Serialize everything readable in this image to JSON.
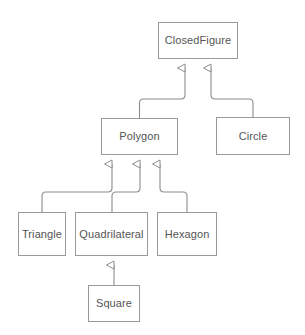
{
  "diagram": {
    "kind": "uml-class-diagram",
    "background_color": "#ffffff",
    "stroke_color": "#9a9a9a",
    "text_color": "#555555",
    "edge_color": "#8c8c8c",
    "nodes": [
      {
        "id": "closedfigure",
        "label": "ClosedFigure",
        "x": 158,
        "y": 22,
        "w": 80,
        "h": 37
      },
      {
        "id": "polygon",
        "label": "Polygon",
        "x": 101,
        "y": 118,
        "w": 77,
        "h": 37
      },
      {
        "id": "circle",
        "label": "Circle",
        "x": 216,
        "y": 117,
        "w": 74,
        "h": 38
      },
      {
        "id": "triangle",
        "label": "Triangle",
        "x": 18,
        "y": 212,
        "w": 48,
        "h": 44
      },
      {
        "id": "quadrilateral",
        "label": "Quadrilateral",
        "x": 75,
        "y": 212,
        "w": 73,
        "h": 44
      },
      {
        "id": "hexagon",
        "label": "Hexagon",
        "x": 157,
        "y": 212,
        "w": 60,
        "h": 44
      },
      {
        "id": "square",
        "label": "Square",
        "x": 88,
        "y": 285,
        "w": 52,
        "h": 37
      }
    ],
    "edges": [
      {
        "id": "polygon-to-closedfigure",
        "from": "polygon",
        "to": "closedfigure",
        "type": "generalization"
      },
      {
        "id": "circle-to-closedfigure",
        "from": "circle",
        "to": "closedfigure",
        "type": "generalization"
      },
      {
        "id": "triangle-to-polygon",
        "from": "triangle",
        "to": "polygon",
        "type": "generalization"
      },
      {
        "id": "quadrilateral-to-polygon",
        "from": "quadrilateral",
        "to": "polygon",
        "type": "generalization"
      },
      {
        "id": "hexagon-to-polygon",
        "from": "hexagon",
        "to": "polygon",
        "type": "generalization"
      },
      {
        "id": "square-to-quadrilateral",
        "from": "square",
        "to": "quadrilateral",
        "type": "generalization"
      }
    ]
  }
}
